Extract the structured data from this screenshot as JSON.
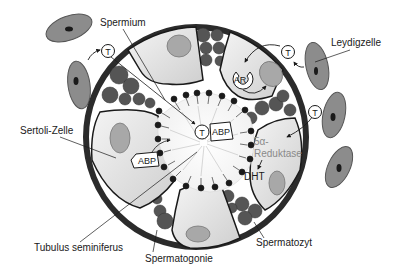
{
  "diagram": {
    "labels": {
      "spermium": "Spermium",
      "leydigzelle": "Leydigzelle",
      "sertoli_zelle": "Sertoli-Zelle",
      "tubulus": "Tubulus seminiferus",
      "spermatogonie": "Spermatogonie",
      "spermatozyt": "Spermatozyt",
      "reduktase_line1": "5α-",
      "reduktase_line2": "Reduktase",
      "dht": "DHT",
      "ar": "AR",
      "abp_center": "ABP",
      "abp_left": "ABP",
      "testosterone": "T"
    },
    "colors": {
      "tubule_wall": "#2b2b2b",
      "sertoli_cell": "#e6e6e6",
      "nucleus": "#a8a8a8",
      "germ_cell": "#555555",
      "leydig_cell": "#8c8c8c",
      "leydig_nucleus": "#1a1a1a",
      "lumen": "#ffffff"
    }
  }
}
